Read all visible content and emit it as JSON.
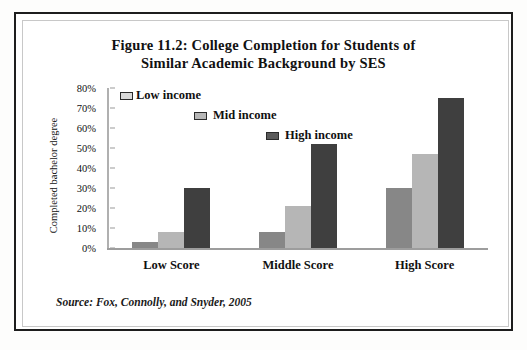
{
  "figure": {
    "title_line1": "Figure 11.2:  College Completion for Students of",
    "title_line2": "Similar Academic Background by SES",
    "source_note": "Source:  Fox, Connolly, and Snyder, 2005"
  },
  "colors": {
    "low_income": "#878787",
    "mid_income": "#b6b6b6",
    "high_income": "#3f3f3f",
    "frame_outer": "#1d1d1d",
    "frame_inner": "#c8c8c8",
    "axis": "#9d9d9d",
    "text": "#111111"
  },
  "legend": {
    "position": "inside-top-left-staircase",
    "entries": [
      {
        "label": "Low income",
        "swatch": "legend-swatch-low-income"
      },
      {
        "label": "Mid income",
        "swatch": "legend-swatch-mid-income"
      },
      {
        "label": "High income",
        "swatch": "legend-swatch-high-income"
      }
    ]
  },
  "axes": {
    "y_title": "Completed bachelor degree",
    "y_ticks": [
      "80%",
      "70%",
      "60%",
      "50%",
      "40%",
      "30%",
      "20%",
      "10%",
      "0%"
    ],
    "x_categories": [
      "Low Score",
      "Middle Score",
      "High Score"
    ]
  },
  "chart_data": {
    "type": "bar",
    "title": "Figure 11.2:  College Completion for Students of Similar Academic Background by SES",
    "xlabel": "",
    "ylabel": "Completed bachelor degree",
    "ylim": [
      0,
      80
    ],
    "y_unit": "percent",
    "y_tick_step": 10,
    "grid": false,
    "legend_position": "inside top-left (staircase)",
    "categories": [
      "Low Score",
      "Middle Score",
      "High Score"
    ],
    "series": [
      {
        "name": "Low income",
        "color": "#878787",
        "values": [
          3,
          8,
          30
        ]
      },
      {
        "name": "Mid income",
        "color": "#b6b6b6",
        "values": [
          8,
          21,
          47
        ]
      },
      {
        "name": "High income",
        "color": "#3f3f3f",
        "values": [
          30,
          52,
          75
        ]
      }
    ],
    "annotations": [
      "Source:  Fox, Connolly, and Snyder, 2005"
    ]
  }
}
